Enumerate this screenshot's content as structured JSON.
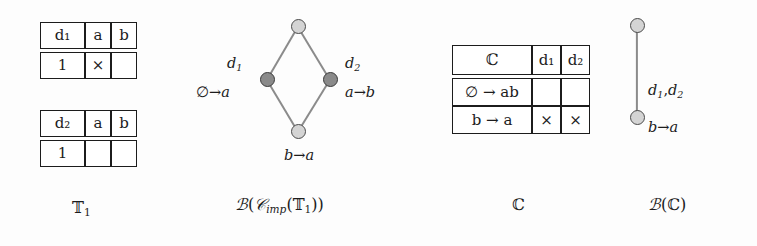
{
  "figure": {
    "background_color": "#fdfdfd",
    "ink_color": "#1c1c1c",
    "node_light_color": "#d4d4d4",
    "node_dark_color": "#8a8a8a",
    "edge_color": "#8b8b8b"
  },
  "panel_t1": {
    "caption": "𝕋₁",
    "tables": [
      {
        "name": "table-d1",
        "header": {
          "object": "d₁",
          "attributes": [
            "a",
            "b"
          ]
        },
        "rows": [
          {
            "object": "1",
            "cells": [
              "×",
              ""
            ]
          }
        ]
      },
      {
        "name": "table-d2",
        "header": {
          "object": "d₂",
          "attributes": [
            "a",
            "b"
          ]
        },
        "rows": [
          {
            "object": "1",
            "cells": [
              "",
              ""
            ]
          }
        ]
      }
    ]
  },
  "panel_lattice_imp": {
    "caption": "ℬ(𝒞ᵢₘₚ(𝕋₁))",
    "caption_parts": {
      "b": "ℬ",
      "open1": "(",
      "c": "𝒞",
      "sub": "imp",
      "open2": "(",
      "t": "𝕋",
      "tsub": "1",
      "close": "))"
    },
    "nodes": [
      {
        "id": "top",
        "shade": "light",
        "x": 298,
        "y": 26,
        "labels": []
      },
      {
        "id": "left",
        "shade": "dark",
        "x": 267,
        "y": 79,
        "labels": [
          "d₁",
          "∅ → a"
        ]
      },
      {
        "id": "right",
        "shade": "dark",
        "x": 330,
        "y": 79,
        "labels": [
          "d₂",
          "a → b"
        ]
      },
      {
        "id": "bottom",
        "shade": "light",
        "x": 298,
        "y": 131,
        "labels": [
          "b → a"
        ]
      }
    ],
    "edges": [
      [
        "top",
        "left"
      ],
      [
        "top",
        "right"
      ],
      [
        "left",
        "bottom"
      ],
      [
        "right",
        "bottom"
      ]
    ],
    "labels": {
      "left_top": "d₁",
      "left_bottom": "∅ → a",
      "right_top": "d₂",
      "right_bottom": "a → b",
      "bottom": "b → a"
    }
  },
  "panel_c": {
    "caption": "ℂ",
    "table": {
      "name": "table-c",
      "header": {
        "corner": "ℂ",
        "columns": [
          "d₁",
          "d₂"
        ]
      },
      "rows": [
        {
          "label": "∅ → ab",
          "cells": [
            "",
            ""
          ]
        },
        {
          "label": "b → a",
          "cells": [
            "×",
            "×"
          ]
        }
      ]
    }
  },
  "panel_lattice_c": {
    "caption": "ℬ(ℂ)",
    "nodes": [
      {
        "id": "top",
        "shade": "light",
        "x": 637,
        "y": 25,
        "labels": []
      },
      {
        "id": "bottom",
        "shade": "light",
        "x": 637,
        "y": 117,
        "labels": [
          "d₁,d₂",
          "b → a"
        ]
      }
    ],
    "edges": [
      [
        "top",
        "bottom"
      ]
    ],
    "labels": {
      "edge": "d₁,d₂",
      "bottom": "b → a"
    }
  }
}
